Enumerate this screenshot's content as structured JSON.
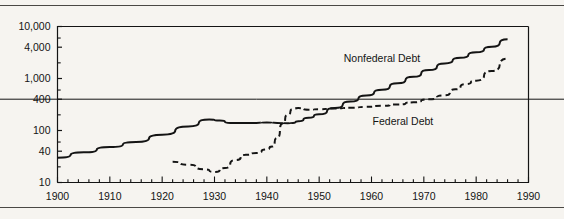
{
  "figure": {
    "background_color": "#f6f4f0",
    "ink_color": "#141414",
    "rule_color": "#4a4845"
  },
  "chart_data": {
    "type": "line",
    "title": "",
    "subtitle": "",
    "xlabel": "",
    "ylabel": "",
    "yscale": "log",
    "xscale": "linear",
    "xlim": [
      1900,
      1990
    ],
    "ylim": [
      10,
      10000
    ],
    "grid": false,
    "reference_lines": [
      {
        "axis": "y",
        "value": 400,
        "style": "solid",
        "width": 1,
        "color": "#141414",
        "full_width": true
      }
    ],
    "legend_position": "inline-annotation",
    "xticks_major": [
      1900,
      1910,
      1920,
      1930,
      1940,
      1950,
      1960,
      1970,
      1980,
      1990
    ],
    "xticklabels": [
      "1900",
      "1910",
      "1920",
      "1930",
      "1940",
      "1950",
      "1960",
      "1970",
      "1980",
      "1990"
    ],
    "xtick_minor_interval": 2,
    "yticks_major": [
      10,
      40,
      100,
      400,
      1000,
      4000,
      10000
    ],
    "yticklabels": [
      "10",
      "40",
      "100",
      "400",
      "1,000",
      "4,000",
      "10,000"
    ],
    "series": [
      {
        "name": "Nonfederal Debt",
        "style": "solid",
        "label_x": 1962,
        "label_y": 2050,
        "x": [
          1900,
          1905,
          1910,
          1915,
          1920,
          1925,
          1929,
          1931,
          1933,
          1935,
          1938,
          1940,
          1942,
          1944,
          1945,
          1946,
          1948,
          1950,
          1953,
          1956,
          1959,
          1962,
          1965,
          1968,
          1971,
          1974,
          1977,
          1980,
          1983,
          1986
        ],
        "y": [
          30,
          38,
          48,
          60,
          83,
          120,
          162,
          155,
          140,
          140,
          140,
          142,
          140,
          138,
          140,
          150,
          175,
          205,
          270,
          360,
          470,
          610,
          810,
          1080,
          1450,
          1950,
          2500,
          3200,
          4100,
          5700
        ]
      },
      {
        "name": "Federal Debt",
        "style": "dashed",
        "label_x": 1966,
        "label_y": 128,
        "x": [
          1922,
          1925,
          1928,
          1930,
          1932,
          1934,
          1936,
          1938,
          1940,
          1941,
          1942,
          1943,
          1944,
          1945,
          1946,
          1948,
          1950,
          1953,
          1956,
          1959,
          1962,
          1965,
          1968,
          1971,
          1974,
          1976,
          1978,
          1980,
          1983,
          1986
        ],
        "y": [
          25,
          22,
          18,
          16,
          19,
          27,
          34,
          37,
          43,
          49,
          72,
          137,
          201,
          259,
          270,
          252,
          257,
          266,
          273,
          285,
          298,
          317,
          348,
          398,
          475,
          620,
          780,
          910,
          1400,
          2400
        ]
      }
    ]
  }
}
